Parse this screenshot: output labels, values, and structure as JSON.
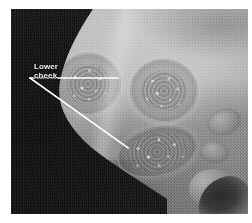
{
  "figure": {
    "kind": "clinical-photograph",
    "modality": "grayscale-photograph",
    "canvas": {
      "width_px": 252,
      "height_px": 223,
      "background_color": "#ffffff"
    },
    "plate": {
      "left_px": 11,
      "top_px": 9,
      "width_px": 237,
      "height_px": 205,
      "background_color": "#8d8d8d",
      "dark_backdrop_color": "#121212",
      "mid_skin_color": "#9e9e9e",
      "highlight_color": "#c9c9c9"
    }
  },
  "annotations": {
    "label_color": "#f2f2f2",
    "leader_color": "#ffffff",
    "items": [
      {
        "id": "lower-cheek",
        "text_line_1": "Lower",
        "text_line_2": "cheek",
        "text_x_px": 23,
        "text_y_px": 53,
        "leader_origin": {
          "x_px": 30,
          "y_px": 78
        },
        "leader_targets": [
          {
            "x_px": 118,
            "y_px": 78,
            "description": "upper-left plaque"
          },
          {
            "x_px": 128,
            "y_px": 148,
            "description": "lower elongated plaque"
          }
        ]
      }
    ]
  },
  "features": [
    {
      "id": "lesion-upper-left",
      "label": "annular plaque with raised border and granular crusted centre",
      "left_px": 44,
      "top_px": 44,
      "width_px": 66,
      "height_px": 62,
      "rotation_deg": -8
    },
    {
      "id": "lesion-upper-right",
      "label": "annular plaque with raised border and granular crusted centre",
      "left_px": 119,
      "top_px": 50,
      "width_px": 68,
      "height_px": 64,
      "rotation_deg": 6
    },
    {
      "id": "lesion-lower",
      "label": "elongated oval plaque on lower cheek / jawline",
      "left_px": 105,
      "top_px": 118,
      "width_px": 82,
      "height_px": 50,
      "rotation_deg": -14
    },
    {
      "id": "papule-right-upper",
      "label": "small satellite papule",
      "left_px": 196,
      "top_px": 100,
      "width_px": 34,
      "height_px": 26,
      "rotation_deg": -18
    },
    {
      "id": "papule-right-lower",
      "label": "small satellite papule",
      "left_px": 188,
      "top_px": 132,
      "width_px": 30,
      "height_px": 22,
      "rotation_deg": 10
    },
    {
      "id": "ear-shadow",
      "label": "shadowed auricle at lower right",
      "left_px": 186,
      "top_px": 168,
      "width_px": 56,
      "height_px": 44,
      "rotation_deg": -12
    }
  ]
}
